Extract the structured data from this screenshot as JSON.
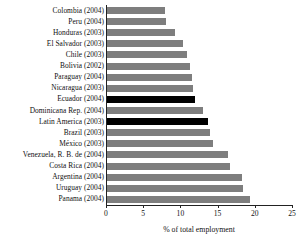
{
  "chart_data": {
    "type": "bar",
    "orientation": "horizontal",
    "title": "",
    "xlabel": "% of total employment",
    "ylabel": "",
    "xlim": [
      0,
      25
    ],
    "xticks": [
      0,
      5,
      10,
      15,
      20,
      25
    ],
    "grid": false,
    "legend": false,
    "categories": [
      "Colombia (2004)",
      "Peru (2004)",
      "Honduras (2003)",
      "El Salvador (2003)",
      "Chile (2003)",
      "Bolivia (2002)",
      "Paraguay (2004)",
      "Nicaragua (2003)",
      "Ecuador (2004)",
      "Dominicana Rep. (2004)",
      "Latin America (2003)",
      "Brazil (2003)",
      "México (2003)",
      "Venezuela, R. B. de (2004)",
      "Costa Rica (2004)",
      "Argentina (2004)",
      "Uruguay (2004)",
      "Panama (2004)"
    ],
    "values": [
      7.9,
      8.1,
      9.3,
      10.3,
      10.9,
      11.3,
      11.6,
      11.7,
      12.0,
      13.0,
      13.7,
      14.0,
      14.4,
      16.4,
      16.7,
      18.3,
      18.4,
      19.4
    ],
    "highlighted": [
      "Ecuador (2004)",
      "Latin America (2003)"
    ],
    "colors": {
      "bar": "#7e7e7e",
      "bar_highlight": "#000000",
      "axis": "#222222",
      "text": "#111111",
      "background": "#ffffff"
    }
  }
}
